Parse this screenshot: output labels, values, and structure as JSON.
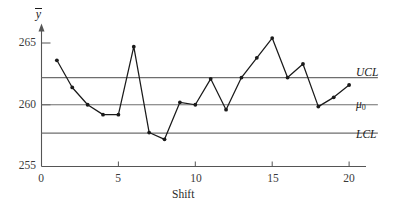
{
  "chart_data": {
    "type": "line",
    "title": "",
    "xlabel": "Shift",
    "ylabel": "ȳ",
    "x": [
      1,
      2,
      3,
      4,
      5,
      6,
      7,
      8,
      9,
      10,
      11,
      12,
      13,
      14,
      15,
      16,
      17,
      18,
      19,
      20
    ],
    "values": [
      263.6,
      261.4,
      260.0,
      259.2,
      259.2,
      264.7,
      257.75,
      257.2,
      260.2,
      260.0,
      262.1,
      259.6,
      262.2,
      263.8,
      265.4,
      262.2,
      263.3,
      259.85,
      260.6,
      261.6
    ],
    "series": [
      {
        "name": "Shift mean",
        "values": [
          263.6,
          261.4,
          260.0,
          259.2,
          259.2,
          264.7,
          257.75,
          257.2,
          260.2,
          260.0,
          262.1,
          259.6,
          262.2,
          263.8,
          265.4,
          262.2,
          263.3,
          259.85,
          260.6,
          261.6
        ]
      }
    ],
    "xlim": [
      0,
      21
    ],
    "ylim": [
      255,
      266.5
    ],
    "xticks": [
      0,
      5,
      10,
      15,
      20
    ],
    "xtick_labels": [
      "0",
      "5",
      "10",
      "15",
      "20"
    ],
    "yticks": [
      255,
      260,
      265
    ],
    "ytick_labels": [
      "255",
      "260",
      "265"
    ],
    "grid": false,
    "legend": "none",
    "reference_lines": [
      {
        "name": "UCL",
        "label": "UCL",
        "value": 262.2
      },
      {
        "name": "mu0",
        "label": "μ",
        "sublabel": "0",
        "value": 260.0
      },
      {
        "name": "LCL",
        "label": "LCL",
        "value": 257.7
      }
    ],
    "colors": {
      "line": "#1a1a1a",
      "marker": "#1a1a1a",
      "reference_line": "#6e6e6e",
      "axis": "#555555",
      "background": "#ffffff"
    }
  }
}
